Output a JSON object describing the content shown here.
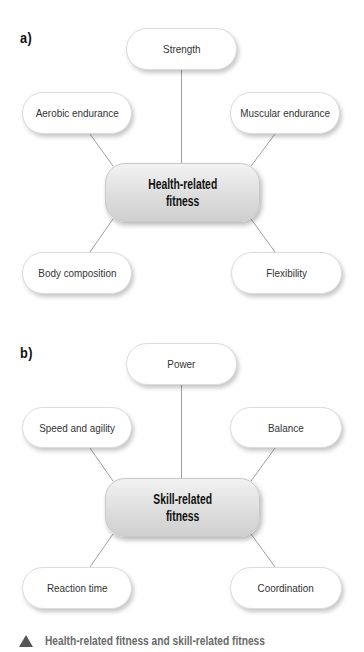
{
  "diagrams": [
    {
      "label": "a)",
      "center": {
        "line1": "Health-related",
        "line2": "fitness"
      },
      "nodes": {
        "top": "Strength",
        "upper_left": "Aerobic endurance",
        "upper_right": "Muscular endurance",
        "lower_left": "Body composition",
        "lower_right": "Flexibility"
      }
    },
    {
      "label": "b)",
      "center": {
        "line1": "Skill-related",
        "line2": "fitness"
      },
      "nodes": {
        "top": "Power",
        "upper_left": "Speed and agility",
        "upper_right": "Balance",
        "lower_left": "Reaction time",
        "lower_right": "Coordination"
      }
    }
  ],
  "caption": {
    "icon": "triangle-icon",
    "text": "Health-related fitness and skill-related fitness"
  },
  "colors": {
    "node_fill": "#ffffff",
    "center_fill": "#dedede",
    "line": "#a0a0a0",
    "caption_text": "#6a6a6a",
    "caption_icon": "#555555"
  }
}
